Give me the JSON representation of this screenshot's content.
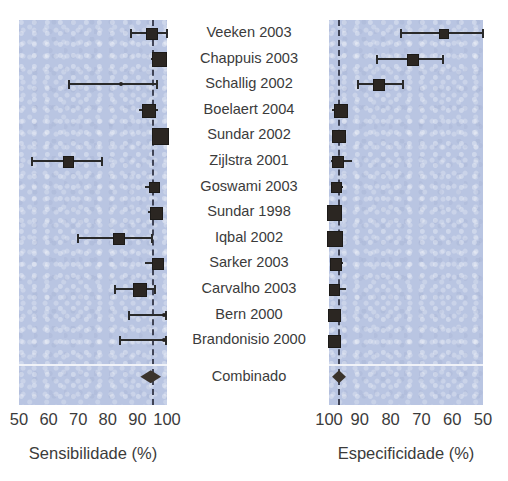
{
  "figure": {
    "type": "forest-plot",
    "summary_label": "Combinado",
    "panel_color": "#b9c5e2",
    "marker_color": "#2b2622"
  },
  "studies": [
    {
      "label": "Veeken 2003"
    },
    {
      "label": "Chappuis 2003"
    },
    {
      "label": "Schallig 2002"
    },
    {
      "label": "Boelaert 2004"
    },
    {
      "label": "Sundar 2002"
    },
    {
      "label": "Zijlstra 2001"
    },
    {
      "label": "Goswami 2003"
    },
    {
      "label": "Sundar 1998"
    },
    {
      "label": "Iqbal 2002"
    },
    {
      "label": "Sarker 2003"
    },
    {
      "label": "Carvalho 2003"
    },
    {
      "label": "Bern 2000"
    },
    {
      "label": "Brandonisio 2000"
    }
  ],
  "left_axis": {
    "title": "Sensibilidade (%)",
    "ticks": [
      "50",
      "60",
      "70",
      "80",
      "90",
      "100"
    ],
    "min": 50,
    "max": 100,
    "reversed": false,
    "reference_value": 95
  },
  "right_axis": {
    "title": "Especificidade (%)",
    "ticks": [
      "100",
      "90",
      "80",
      "70",
      "60",
      "50"
    ],
    "min": 50,
    "max": 100,
    "reversed": true,
    "reference_value": 97
  },
  "chart_data": {
    "type": "forest",
    "title": "",
    "categories": [
      "Veeken 2003",
      "Chappuis 2003",
      "Schallig 2002",
      "Boelaert 2004",
      "Sundar 2002",
      "Zijlstra 2001",
      "Goswami 2003",
      "Sundar 1998",
      "Iqbal 2002",
      "Sarker 2003",
      "Carvalho 2003",
      "Bern 2000",
      "Brandonisio 2000"
    ],
    "series": [
      {
        "name": "Sensibilidade (%)",
        "xlabel": "Sensibilidade (%)",
        "xlim": [
          50,
          100
        ],
        "reversed": false,
        "reference_line": 95,
        "grid": false,
        "points": [
          {
            "study": "Veeken 2003",
            "estimate": 94.5,
            "ci_low": 88.0,
            "ci_high": 100.0,
            "weight": 0.35
          },
          {
            "study": "Chappuis 2003",
            "estimate": 97.0,
            "ci_low": 94.5,
            "ci_high": 100.0,
            "weight": 0.62
          },
          {
            "study": "Schallig 2002",
            "estimate": 84.5,
            "ci_low": 67.0,
            "ci_high": 96.5,
            "weight": 0.12
          },
          {
            "study": "Boelaert 2004",
            "estimate": 93.5,
            "ci_low": 90.5,
            "ci_high": 97.0,
            "weight": 0.52
          },
          {
            "study": "Sundar 2002",
            "estimate": 97.5,
            "ci_low": 96.0,
            "ci_high": 99.5,
            "weight": 0.8
          },
          {
            "study": "Zijlstra 2001",
            "estimate": 66.5,
            "ci_low": 54.5,
            "ci_high": 78.0,
            "weight": 0.28
          },
          {
            "study": "Goswami 2003",
            "estimate": 95.5,
            "ci_low": 92.5,
            "ci_high": 97.5,
            "weight": 0.3
          },
          {
            "study": "Sundar 1998",
            "estimate": 96.0,
            "ci_low": 93.5,
            "ci_high": 98.5,
            "weight": 0.48
          },
          {
            "study": "Iqbal 2002",
            "estimate": 83.5,
            "ci_low": 70.0,
            "ci_high": 95.0,
            "weight": 0.4
          },
          {
            "study": "Sarker 2003",
            "estimate": 96.5,
            "ci_low": 92.5,
            "ci_high": 99.0,
            "weight": 0.35
          },
          {
            "study": "Carvalho 2003",
            "estimate": 90.5,
            "ci_low": 82.5,
            "ci_high": 96.0,
            "weight": 0.55
          },
          {
            "study": "Bern 2000",
            "estimate": 99.0,
            "ci_low": 87.0,
            "ci_high": 99.5,
            "weight": 0.1
          },
          {
            "study": "Brandonisio 2000",
            "estimate": 99.0,
            "ci_low": 84.0,
            "ci_high": 99.5,
            "weight": 0.1
          }
        ],
        "summary": {
          "label": "Combinado",
          "estimate": 95.0,
          "ci_low": 91.0,
          "ci_high": 98.0
        }
      },
      {
        "name": "Especificidade (%)",
        "xlabel": "Especificidade (%)",
        "xlim": [
          50,
          100
        ],
        "reversed": true,
        "reference_line": 97,
        "grid": false,
        "points": [
          {
            "study": "Veeken 2003",
            "estimate": 63.0,
            "ci_low": 50.0,
            "ci_high": 76.5,
            "weight": 0.18
          },
          {
            "study": "Chappuis 2003",
            "estimate": 73.0,
            "ci_low": 63.0,
            "ci_high": 84.5,
            "weight": 0.38
          },
          {
            "study": "Schallig 2002",
            "estimate": 84.0,
            "ci_low": 76.0,
            "ci_high": 90.5,
            "weight": 0.36
          },
          {
            "study": "Boelaert 2004",
            "estimate": 96.5,
            "ci_low": 94.0,
            "ci_high": 99.0,
            "weight": 0.56
          },
          {
            "study": "Sundar 2002",
            "estimate": 97.0,
            "ci_low": 95.5,
            "ci_high": 98.5,
            "weight": 0.52
          },
          {
            "study": "Zijlstra 2001",
            "estimate": 97.5,
            "ci_low": 92.5,
            "ci_high": 99.5,
            "weight": 0.34
          },
          {
            "study": "Goswami 2003",
            "estimate": 98.0,
            "ci_low": 95.5,
            "ci_high": 99.5,
            "weight": 0.3
          },
          {
            "study": "Sundar 1998",
            "estimate": 98.5,
            "ci_low": 97.0,
            "ci_high": 99.5,
            "weight": 0.68
          },
          {
            "study": "Iqbal 2002",
            "estimate": 98.5,
            "ci_low": 97.0,
            "ci_high": 99.5,
            "weight": 0.74
          },
          {
            "study": "Sarker 2003",
            "estimate": 98.0,
            "ci_low": 95.5,
            "ci_high": 99.5,
            "weight": 0.4
          },
          {
            "study": "Carvalho 2003",
            "estimate": 98.5,
            "ci_low": 94.5,
            "ci_high": 99.5,
            "weight": 0.3
          },
          {
            "study": "Bern 2000",
            "estimate": 98.5,
            "ci_low": 96.0,
            "ci_high": 99.5,
            "weight": 0.46
          },
          {
            "study": "Brandonisio 2000",
            "estimate": 98.5,
            "ci_low": 96.0,
            "ci_high": 99.5,
            "weight": 0.46
          }
        ],
        "summary": {
          "label": "Combinado",
          "estimate": 97.0,
          "ci_low": 94.5,
          "ci_high": 99.0
        }
      }
    ]
  }
}
